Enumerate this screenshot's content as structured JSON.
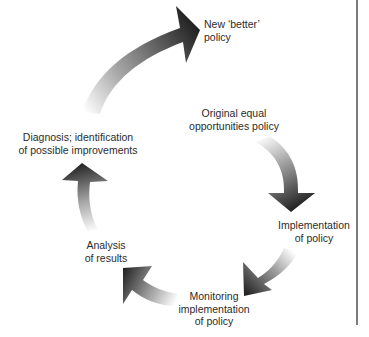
{
  "diagram": {
    "type": "cycle",
    "colors": {
      "arrow_dark": "#1f1f1f",
      "arrow_fade": "#ffffff",
      "text": "#2b2b2b",
      "rule": "#7d7d7d",
      "background": "#ffffff"
    },
    "nodes": [
      {
        "id": "original",
        "lines": [
          "Original equal",
          "opportunities policy"
        ]
      },
      {
        "id": "implementation",
        "lines": [
          "Implementation",
          "of policy"
        ]
      },
      {
        "id": "monitoring",
        "lines": [
          "Monitoring",
          "implementation",
          "of policy"
        ]
      },
      {
        "id": "analysis",
        "lines": [
          "Analysis",
          "of results"
        ]
      },
      {
        "id": "diagnosis",
        "lines": [
          "Diagnosis; identification",
          "of possible improvements"
        ]
      },
      {
        "id": "new-policy",
        "lines": [
          "New ‘better’",
          "policy"
        ]
      }
    ],
    "edges": [
      {
        "from": "original",
        "to": "implementation"
      },
      {
        "from": "implementation",
        "to": "monitoring"
      },
      {
        "from": "monitoring",
        "to": "analysis"
      },
      {
        "from": "analysis",
        "to": "diagnosis"
      },
      {
        "from": "diagnosis",
        "to": "new-policy"
      }
    ]
  }
}
